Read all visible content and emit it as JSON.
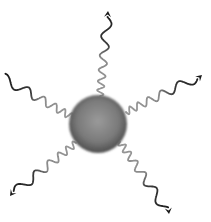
{
  "diagram": {
    "title": "",
    "background": "#ffffff",
    "sphere": {
      "cx": 98,
      "cy": 124,
      "r": 29,
      "center_color": "#9a9a9a",
      "edge_color": "#4e4e4e"
    },
    "wave_colors": {
      "outer": "#1a1a1a",
      "inner": "#9a9a9a"
    },
    "waves": [
      {
        "name": "up",
        "x1": 100,
        "y1": 96,
        "x2": 108,
        "y2": 11,
        "arrow": true
      },
      {
        "name": "upper-right",
        "x1": 126,
        "y1": 112,
        "x2": 202,
        "y2": 75,
        "arrow": true
      },
      {
        "name": "upper-left",
        "x1": 72,
        "y1": 117,
        "x2": 3,
        "y2": 78,
        "arrow": false
      },
      {
        "name": "lower-left",
        "x1": 76,
        "y1": 143,
        "x2": 10,
        "y2": 196,
        "arrow": true
      },
      {
        "name": "lower-right",
        "x1": 120,
        "y1": 142,
        "x2": 169,
        "y2": 214,
        "arrow": true
      }
    ]
  }
}
